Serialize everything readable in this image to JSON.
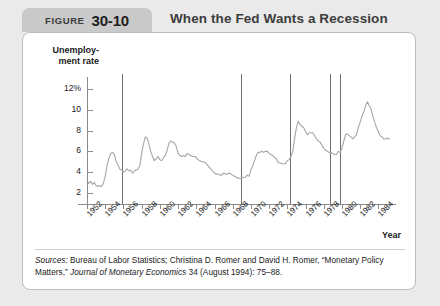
{
  "figure": {
    "label": "FIGURE",
    "number": "30-10",
    "title": "When the Fed Wants a Recession"
  },
  "source": {
    "prefix": "Sources:",
    "text_1": " Bureau of Labor Statistics; Christina D. Romer and David H. Romer, “Monetary Policy Matters,” ",
    "journal": "Journal of Monetary Economics",
    "text_2": " 34 (August 1994): 75–88."
  },
  "chart_data": {
    "type": "line",
    "title": "When the Fed Wants a Recession",
    "xlabel": "Year",
    "ylabel": "Unemployment rate",
    "ylabel_line1": "Unemploy-",
    "ylabel_line2": "ment rate",
    "xlim": [
      1952,
      1985.5
    ],
    "ylim": [
      1.2,
      12.8
    ],
    "grid": false,
    "legend": false,
    "ytick_labels": [
      "12%",
      "10",
      "8",
      "6",
      "4",
      "2"
    ],
    "ytick_values": [
      12,
      10,
      8,
      6,
      4,
      2
    ],
    "xtick_labels": [
      "1952",
      "1954",
      "1956",
      "1958",
      "1960",
      "1962",
      "1964",
      "1966",
      "1968",
      "1970",
      "1972",
      "1974",
      "1976",
      "1978",
      "1980",
      "1982",
      "1984"
    ],
    "xtick_values": [
      1952,
      1954,
      1956,
      1958,
      1960,
      1962,
      1964,
      1966,
      1968,
      1970,
      1972,
      1974,
      1976,
      1978,
      1980,
      1982,
      1984
    ],
    "series_name": "Unemployment rate",
    "series_color": "#a6a6a6",
    "annotation_color": "#6f6f6f",
    "annotation_label": "Contractionary monetary policy shift",
    "vertical_lines": [
      1955.8,
      1968.9,
      1974.3,
      1978.7,
      1979.8
    ],
    "x": [
      1952.0,
      1952.2,
      1952.4,
      1952.6,
      1952.8,
      1953.0,
      1953.2,
      1953.4,
      1953.6,
      1953.8,
      1954.0,
      1954.2,
      1954.4,
      1954.6,
      1954.8,
      1955.0,
      1955.2,
      1955.4,
      1955.6,
      1955.8,
      1956.0,
      1956.2,
      1956.4,
      1956.6,
      1956.8,
      1957.0,
      1957.2,
      1957.4,
      1957.6,
      1957.8,
      1958.0,
      1958.2,
      1958.4,
      1958.6,
      1958.8,
      1959.0,
      1959.2,
      1959.4,
      1959.6,
      1959.8,
      1960.0,
      1960.2,
      1960.4,
      1960.6,
      1960.8,
      1961.0,
      1961.2,
      1961.4,
      1961.6,
      1961.8,
      1962.0,
      1962.2,
      1962.4,
      1962.6,
      1962.8,
      1963.0,
      1963.2,
      1963.4,
      1963.6,
      1963.8,
      1964.0,
      1964.2,
      1964.4,
      1964.6,
      1964.8,
      1965.0,
      1965.2,
      1965.4,
      1965.6,
      1965.8,
      1966.0,
      1966.2,
      1966.4,
      1966.6,
      1966.8,
      1967.0,
      1967.2,
      1967.4,
      1967.6,
      1967.8,
      1968.0,
      1968.2,
      1968.4,
      1968.6,
      1968.8,
      1969.0,
      1969.2,
      1969.4,
      1969.6,
      1969.8,
      1970.0,
      1970.2,
      1970.4,
      1970.6,
      1970.8,
      1971.0,
      1971.2,
      1971.4,
      1971.6,
      1971.8,
      1972.0,
      1972.2,
      1972.4,
      1972.6,
      1972.8,
      1973.0,
      1973.2,
      1973.4,
      1973.6,
      1973.8,
      1974.0,
      1974.2,
      1974.4,
      1974.6,
      1974.8,
      1975.0,
      1975.2,
      1975.4,
      1975.6,
      1975.8,
      1976.0,
      1976.2,
      1976.4,
      1976.6,
      1976.8,
      1977.0,
      1977.2,
      1977.4,
      1977.6,
      1977.8,
      1978.0,
      1978.2,
      1978.4,
      1978.6,
      1978.8,
      1979.0,
      1979.2,
      1979.4,
      1979.6,
      1979.8,
      1980.0,
      1980.2,
      1980.4,
      1980.6,
      1980.8,
      1981.0,
      1981.2,
      1981.4,
      1981.6,
      1981.8,
      1982.0,
      1982.2,
      1982.4,
      1982.6,
      1982.8,
      1983.0,
      1983.2,
      1983.4,
      1983.6,
      1983.8,
      1984.0,
      1984.2,
      1984.4,
      1984.6,
      1984.8,
      1985.0,
      1985.2
    ],
    "values": [
      3.2,
      2.9,
      3.1,
      2.8,
      3.0,
      2.7,
      2.6,
      2.7,
      2.6,
      2.9,
      3.6,
      4.6,
      5.3,
      5.8,
      5.9,
      5.7,
      5.0,
      4.7,
      4.3,
      4.2,
      4.0,
      4.1,
      4.3,
      4.1,
      4.2,
      3.9,
      4.1,
      4.2,
      4.3,
      4.6,
      5.8,
      6.7,
      7.4,
      7.3,
      6.7,
      6.0,
      5.5,
      5.1,
      5.3,
      5.5,
      5.2,
      5.1,
      5.4,
      5.6,
      6.1,
      6.8,
      7.0,
      6.9,
      6.8,
      6.5,
      5.8,
      5.6,
      5.5,
      5.6,
      5.5,
      5.8,
      5.7,
      5.6,
      5.5,
      5.5,
      5.4,
      5.2,
      5.1,
      5.0,
      5.0,
      4.9,
      4.7,
      4.5,
      4.3,
      4.1,
      3.9,
      3.8,
      3.8,
      3.7,
      3.7,
      3.9,
      3.8,
      3.8,
      3.9,
      3.8,
      3.7,
      3.6,
      3.5,
      3.4,
      3.4,
      3.4,
      3.5,
      3.5,
      3.7,
      3.6,
      4.2,
      4.6,
      5.1,
      5.6,
      5.9,
      5.9,
      6.0,
      5.9,
      6.0,
      6.0,
      5.8,
      5.7,
      5.6,
      5.4,
      5.3,
      4.9,
      4.9,
      4.8,
      4.8,
      4.8,
      5.1,
      5.2,
      5.5,
      6.0,
      7.2,
      8.3,
      8.9,
      8.6,
      8.4,
      8.3,
      7.9,
      7.6,
      7.8,
      7.8,
      7.8,
      7.5,
      7.2,
      7.0,
      6.9,
      6.6,
      6.3,
      6.1,
      6.0,
      5.9,
      5.9,
      5.8,
      5.7,
      5.7,
      6.0,
      5.9,
      6.3,
      7.0,
      7.6,
      7.7,
      7.5,
      7.4,
      7.2,
      7.4,
      7.6,
      8.3,
      8.8,
      9.4,
      9.8,
      10.4,
      10.8,
      10.4,
      10.1,
      9.4,
      8.8,
      8.3,
      7.9,
      7.5,
      7.4,
      7.2,
      7.2,
      7.3,
      7.2
    ]
  }
}
